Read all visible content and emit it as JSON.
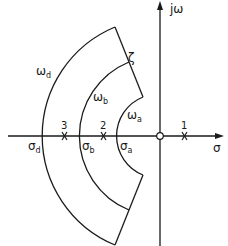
{
  "diagram": {
    "type": "s-plane pole region diagram",
    "axes": {
      "real_label": "σ",
      "imag_label": "jω"
    },
    "arcs": [
      {
        "name": "omega_a",
        "label": "ω",
        "sub": "a",
        "axis_label": "σ",
        "axis_sub": "a"
      },
      {
        "name": "omega_b",
        "label": "ω",
        "sub": "b",
        "axis_label": "σ",
        "axis_sub": "b"
      },
      {
        "name": "omega_d",
        "label": "ω",
        "sub": "d",
        "axis_label": "σ",
        "axis_sub": "d"
      }
    ],
    "damping_line_label": "ζ",
    "poles": [
      {
        "label": "1"
      },
      {
        "label": "2"
      },
      {
        "label": "3"
      }
    ],
    "colors": {
      "line": "#1a1a1a",
      "background": "#ffffff"
    }
  }
}
